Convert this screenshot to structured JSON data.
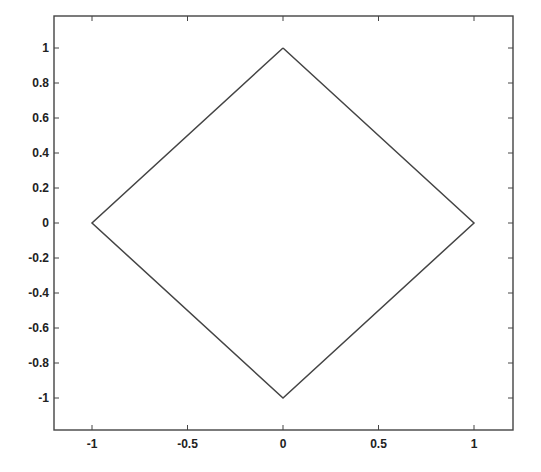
{
  "chart_data": {
    "type": "line",
    "title": "",
    "xlabel": "",
    "ylabel": "",
    "xlim": [
      -1.2,
      1.2
    ],
    "ylim": [
      -1.2,
      1.2
    ],
    "grid": false,
    "legend": null,
    "xticks": [
      -1,
      -0.5,
      0,
      0.5,
      1
    ],
    "xtick_labels": [
      "-1",
      "-0.5",
      "0",
      "0.5",
      "1"
    ],
    "yticks": [
      1,
      0.8,
      0.6,
      0.4,
      0.2,
      0,
      -0.2,
      -0.4,
      -0.6,
      -0.8,
      -1
    ],
    "ytick_labels": [
      "1",
      "0.8",
      "0.6",
      "0.4",
      "0.2",
      "0",
      "-0.2",
      "-0.4",
      "-0.6",
      "-0.8",
      "-1"
    ],
    "series": [
      {
        "name": "diamond",
        "color": "#444444",
        "x": [
          0,
          1,
          0,
          -1,
          0
        ],
        "y": [
          1,
          0,
          -1,
          0,
          1
        ]
      }
    ]
  }
}
